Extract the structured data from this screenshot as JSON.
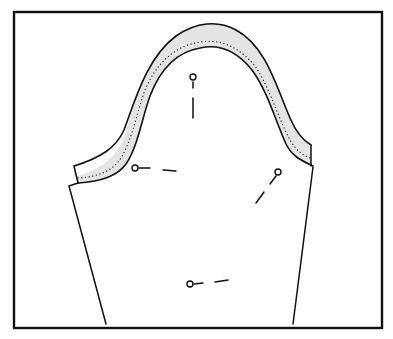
{
  "figure": {
    "colors": {
      "background": "#ffffff",
      "line": "#111111",
      "seam_allowance_fill": "#e4e4e4",
      "stitch_dots": "#222222"
    },
    "frame": {
      "x": 14,
      "y": 12,
      "width": 368,
      "height": 316,
      "stroke_width": 2.4
    },
    "sleeve": {
      "outer_cap_path": "M74,166 L74,177 C100,170 116,158 124,138 C134,104 146,58 176,36 C196,22 218,20 236,30 C266,46 276,86 290,118 C296,132 302,140 311,145 L311,166 C300,160 292,156 286,144 C276,122 268,92 252,70 C236,50 218,44 200,48 C176,52 160,70 150,96 C142,118 138,146 126,164 C116,178 96,182 78,183 Z",
      "outer_edge_path": "M74,166 C100,158 116,148 124,130 C134,104 146,58 176,36 C196,22 218,20 236,30 C266,46 276,86 290,118 C296,132 302,140 311,145",
      "inner_edge_path": "M78,183 C96,182 116,178 126,164 C138,146 142,118 150,96 C160,70 176,52 200,48 C218,44 236,50 252,70 C268,92 276,122 286,144 C292,156 300,160 313,166",
      "stitch_path": "M78,178 C96,177 112,172 121,158 C132,140 137,112 145,90 C156,64 174,46 200,42 C220,39 238,46 255,66 C270,88 278,118 290,140 C296,150 302,155 310,158",
      "left_cap_end": "M74,166 L78,183",
      "right_cap_end": "M311,145 L311,166",
      "left_side": "M69,186 L78,183 M69,186 L106,324",
      "right_side": "M313,167 L293,324"
    },
    "pins": [
      {
        "name": "pin-top",
        "head": [
          193,
          77
        ],
        "shaft": [
          [
            193,
            82
          ],
          [
            193,
            88
          ]
        ],
        "dash": [
          [
            193,
            98
          ],
          [
            193,
            118
          ]
        ]
      },
      {
        "name": "pin-left",
        "head": [
          135,
          168
        ],
        "shaft": [
          [
            139,
            168
          ],
          [
            150,
            168
          ]
        ],
        "dash": [
          [
            163,
            170
          ],
          [
            176,
            171
          ]
        ]
      },
      {
        "name": "pin-right",
        "head": [
          278,
          172
        ],
        "shaft": [
          [
            276,
            176
          ],
          [
            270,
            184
          ]
        ],
        "dash": [
          [
            264,
            192
          ],
          [
            256,
            203
          ]
        ]
      },
      {
        "name": "pin-bottom",
        "head": [
          190,
          284
        ],
        "shaft": [
          [
            194,
            284
          ],
          [
            203,
            283
          ]
        ],
        "dash": [
          [
            215,
            282
          ],
          [
            228,
            280
          ]
        ]
      }
    ]
  }
}
